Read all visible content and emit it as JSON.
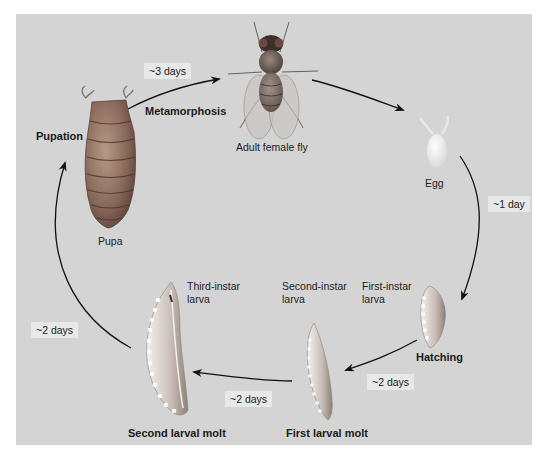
{
  "diagram": {
    "background_color": "#d4d4d4",
    "stages": [
      {
        "id": "adult",
        "label": "Adult female fly"
      },
      {
        "id": "egg",
        "label": "Egg"
      },
      {
        "id": "first_instar",
        "label": "First-instar\nlarva"
      },
      {
        "id": "second_instar",
        "label": "Second-instar\nlarva"
      },
      {
        "id": "third_instar",
        "label": "Third-instar\nlarva"
      },
      {
        "id": "pupa",
        "label": "Pupa"
      }
    ],
    "events": [
      {
        "id": "metamorphosis",
        "label": "Metamorphosis"
      },
      {
        "id": "hatching",
        "label": "Hatching"
      },
      {
        "id": "first_molt",
        "label": "First larval molt"
      },
      {
        "id": "second_molt",
        "label": "Second larval molt"
      },
      {
        "id": "pupation",
        "label": "Pupation"
      }
    ],
    "durations": [
      {
        "id": "pupa_to_adult",
        "label": "~3 days"
      },
      {
        "id": "egg_to_first",
        "label": "~1 day"
      },
      {
        "id": "first_to_second",
        "label": "~2 days"
      },
      {
        "id": "second_to_third",
        "label": "~2 days"
      },
      {
        "id": "third_to_pupa",
        "label": "~2 days"
      }
    ],
    "flow": [
      "Adult female fly",
      "Egg",
      "First-instar larva",
      "Second-instar larva",
      "Third-instar larva",
      "Pupa",
      "Adult female fly"
    ]
  }
}
